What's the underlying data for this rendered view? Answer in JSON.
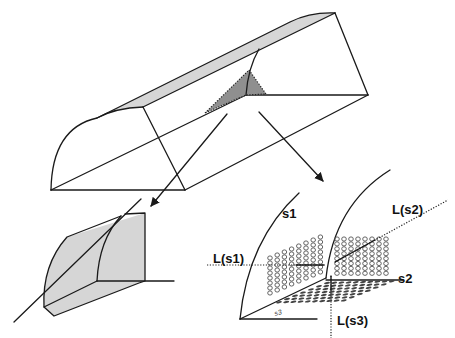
{
  "figure": {
    "colors": {
      "stroke": "#1a1a1a",
      "light_shade": "#d6d6d6",
      "dark_shade": "#8f8f8f"
    }
  },
  "detail_right": {
    "labels": {
      "s1": "s1",
      "s2": "s2",
      "s3": "s3",
      "L_s1": "L(s1)",
      "L_s2": "L(s2)",
      "L_s3": "L(s3)"
    },
    "grid_s1": {
      "columns": 8,
      "rows": 8
    },
    "grid_s2": {
      "columns": 8,
      "rows": 8
    },
    "grid_s3": {
      "columns": 10,
      "rows": 7
    }
  }
}
